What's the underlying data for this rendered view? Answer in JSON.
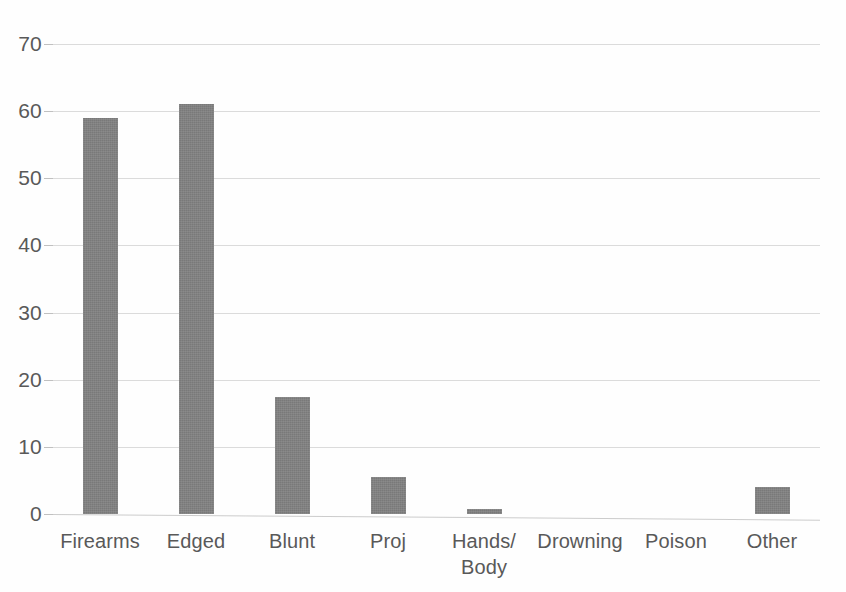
{
  "chart_data": {
    "type": "bar",
    "title": "",
    "subtitle": "",
    "xlabel": "",
    "ylabel": "",
    "categories": [
      "Firearms",
      "Edged",
      "Blunt",
      "Proj",
      "Hands/\nBody",
      "Drowning",
      "Poison",
      "Other"
    ],
    "values": [
      59,
      61,
      17.5,
      5.5,
      0.7,
      0,
      0,
      4
    ],
    "ylim": [
      0,
      70
    ],
    "yticks": [
      0,
      10,
      20,
      30,
      40,
      50,
      60,
      70
    ],
    "ytick_labels": [
      "0",
      "10",
      "20",
      "30",
      "40",
      "50",
      "60",
      "70"
    ],
    "grid": true,
    "grid_axis": "y",
    "legend": false,
    "legend_position": "none",
    "series": [
      {
        "name": "Count",
        "values": [
          59,
          61,
          17.5,
          5.5,
          0.7,
          0,
          0,
          4
        ]
      }
    ],
    "colors": {
      "bar": "#808080",
      "gridline": "#d9d9d9",
      "axis_line": "#c9c9c9",
      "tick_label": "#595959",
      "category_label": "#595959",
      "background": "#fefefe"
    }
  }
}
